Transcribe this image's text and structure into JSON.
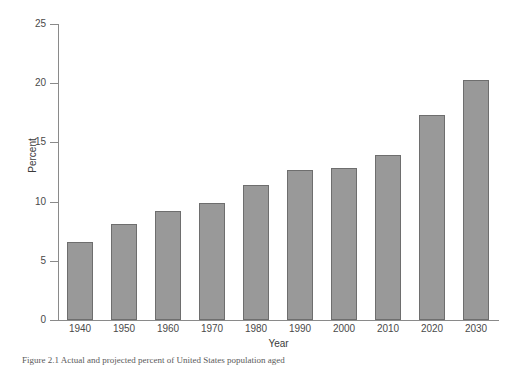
{
  "chart_data": {
    "type": "bar",
    "title": "",
    "xlabel": "Year",
    "ylabel": "Percent",
    "categories": [
      "1940",
      "1950",
      "1960",
      "1970",
      "1980",
      "1990",
      "2000",
      "2010",
      "2020",
      "2030"
    ],
    "values": [
      6.6,
      8.1,
      9.2,
      9.9,
      11.4,
      12.7,
      12.8,
      13.9,
      17.3,
      20.3
    ],
    "ylim": [
      0,
      25
    ],
    "yticks": [
      0,
      5,
      10,
      15,
      20,
      25
    ],
    "ytick_labels": [
      "0",
      "5",
      "10",
      "15",
      "20",
      "25"
    ],
    "xlim_categories": 10,
    "grid": false,
    "legend": "none",
    "bar_color": "#999999",
    "bar_edge_color": "#6e6e6e",
    "axis_color": "#8a8a8a"
  },
  "caption": {
    "text": "Figure 2.1  Actual and projected percent of United States population aged"
  }
}
